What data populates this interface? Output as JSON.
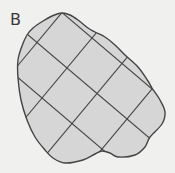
{
  "figure": {
    "label": "B",
    "colors": {
      "background": "#f0f0ef",
      "fill": "#d6d6d6",
      "stroke": "#444444",
      "label": "#3a3a3a"
    },
    "outline_points": [
      [
        62,
        13
      ],
      [
        70,
        15
      ],
      [
        78,
        20
      ],
      [
        88,
        28
      ],
      [
        95,
        32
      ],
      [
        105,
        37
      ],
      [
        115,
        45
      ],
      [
        125,
        55
      ],
      [
        138,
        67
      ],
      [
        148,
        81
      ],
      [
        152,
        88
      ],
      [
        160,
        100
      ],
      [
        165,
        112
      ],
      [
        162,
        124
      ],
      [
        150,
        137
      ],
      [
        145,
        147
      ],
      [
        135,
        155
      ],
      [
        118,
        157
      ],
      [
        110,
        153
      ],
      [
        102,
        151
      ],
      [
        95,
        154
      ],
      [
        83,
        160
      ],
      [
        65,
        163
      ],
      [
        53,
        158
      ],
      [
        45,
        150
      ],
      [
        35,
        137
      ],
      [
        27,
        120
      ],
      [
        21,
        100
      ],
      [
        18,
        78
      ],
      [
        18,
        60
      ],
      [
        22,
        46
      ],
      [
        27,
        35
      ],
      [
        33,
        28
      ],
      [
        43,
        21
      ],
      [
        52,
        16
      ]
    ],
    "grid": {
      "origin": [
        67,
        68
      ],
      "down_right_step": [
        30,
        25.5
      ],
      "up_right_step": [
        25,
        -30
      ],
      "down_right_line_offsets": [
        -1,
        0,
        1
      ],
      "up_right_line_offsets": [
        -1,
        0,
        1,
        2
      ]
    }
  }
}
